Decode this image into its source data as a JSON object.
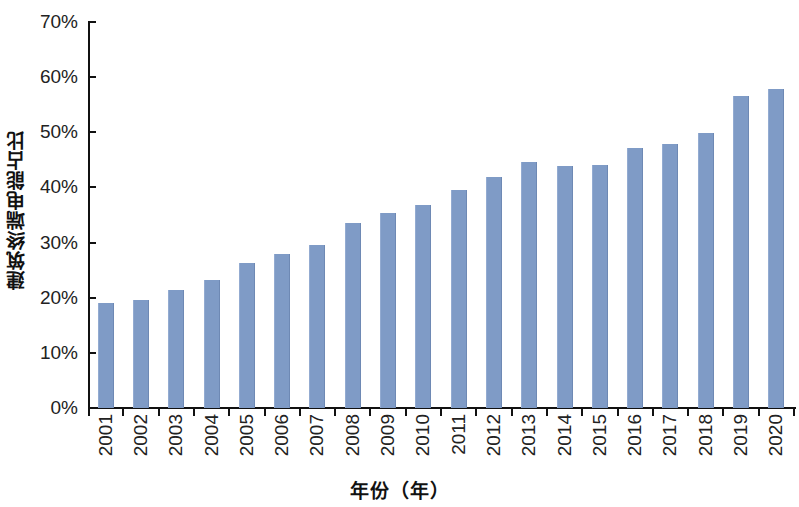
{
  "chart_data": {
    "type": "bar",
    "title": "",
    "subtitle": "",
    "xlabel": "年份（年）",
    "ylabel": "建筑终端电能占比",
    "categories": [
      "2001",
      "2002",
      "2003",
      "2004",
      "2005",
      "2006",
      "2007",
      "2008",
      "2009",
      "2010",
      "2011",
      "2012",
      "2013",
      "2014",
      "2015",
      "2016",
      "2017",
      "2018",
      "2019",
      "2020"
    ],
    "values": [
      19.1,
      19.5,
      21.4,
      23.3,
      26.3,
      28.0,
      29.6,
      33.5,
      35.3,
      36.8,
      39.5,
      41.9,
      44.6,
      43.8,
      44.0,
      47.1,
      47.8,
      49.9,
      56.5,
      57.8
    ],
    "value_unit": "%",
    "ylim": [
      0,
      70
    ],
    "ytick_values": [
      0,
      10,
      20,
      30,
      40,
      50,
      60,
      70
    ],
    "ytick_labels": [
      "0%",
      "10%",
      "20%",
      "30%",
      "40%",
      "50%",
      "60%",
      "70%"
    ],
    "grid": false,
    "legend": null,
    "legend_position": "none",
    "bar_color": "#7f9bc6",
    "axis_color": "#111111",
    "background_color": "#ffffff",
    "xtick_label_rotation": 90
  }
}
